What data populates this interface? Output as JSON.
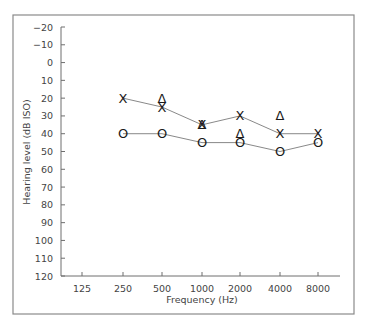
{
  "chart_data": {
    "type": "line",
    "title": "",
    "xlabel": "Frequency (Hz)",
    "ylabel": "Hearing level (dB ISO)",
    "x": [
      "125",
      "250",
      "500",
      "1000",
      "2000",
      "4000",
      "8000"
    ],
    "yticks": [
      -20,
      -10,
      0,
      10,
      20,
      30,
      40,
      50,
      60,
      70,
      80,
      90,
      100,
      110,
      120
    ],
    "ylim": [
      -20,
      120
    ],
    "y_inverted": true,
    "grid": false,
    "legend": null,
    "series": [
      {
        "name": "X",
        "marker": "X",
        "connected": true,
        "points": [
          {
            "x": "250",
            "y": 20
          },
          {
            "x": "500",
            "y": 25
          },
          {
            "x": "1000",
            "y": 35
          },
          {
            "x": "2000",
            "y": 30
          },
          {
            "x": "4000",
            "y": 40
          },
          {
            "x": "8000",
            "y": 40
          }
        ]
      },
      {
        "name": "O",
        "marker": "O",
        "connected": true,
        "points": [
          {
            "x": "250",
            "y": 40
          },
          {
            "x": "500",
            "y": 40
          },
          {
            "x": "1000",
            "y": 45
          },
          {
            "x": "2000",
            "y": 45
          },
          {
            "x": "4000",
            "y": 50
          },
          {
            "x": "8000",
            "y": 45
          }
        ]
      },
      {
        "name": "Δ",
        "marker": "Δ",
        "connected": false,
        "points": [
          {
            "x": "500",
            "y": 20
          },
          {
            "x": "1000",
            "y": 35
          },
          {
            "x": "2000",
            "y": 40
          },
          {
            "x": "4000",
            "y": 30
          }
        ]
      }
    ]
  },
  "layout": {
    "frame": {
      "x": 13,
      "y": 15,
      "w": 341,
      "h": 299
    },
    "plot": {
      "x0": 61,
      "x1": 340,
      "y_top": 27,
      "y_bottom": 276
    },
    "x_positions": {
      "125": 82,
      "250": 123,
      "500": 162,
      "1000": 202,
      "2000": 240,
      "4000": 280,
      "8000": 318
    },
    "ylabel_pos": {
      "x": 30,
      "y": 152
    },
    "xlabel_pos": {
      "x": 202,
      "y": 303
    }
  }
}
